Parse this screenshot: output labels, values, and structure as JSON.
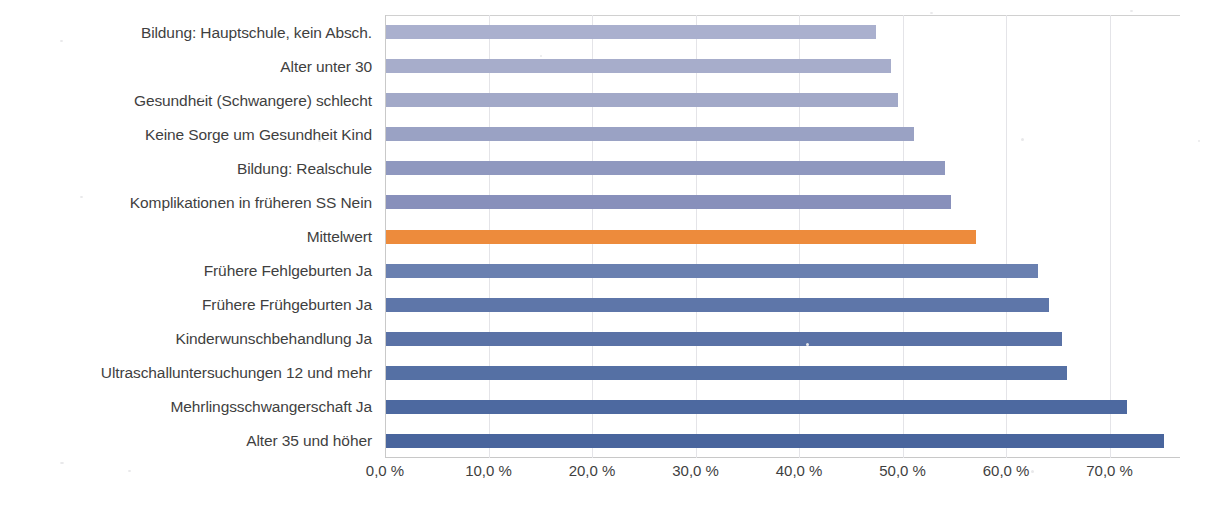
{
  "chart_data": {
    "type": "bar",
    "orientation": "horizontal",
    "title": "",
    "xlabel": "",
    "ylabel": "",
    "xlim": [
      0,
      76.8
    ],
    "grid": true,
    "legend": false,
    "tick_labels": [
      "0,0 %",
      "10,0 %",
      "20,0 %",
      "30,0 %",
      "40,0 %",
      "50,0 %",
      "60,0 %",
      "70,0 %"
    ],
    "tick_values": [
      0,
      10,
      20,
      30,
      40,
      50,
      60,
      70
    ],
    "categories": [
      "Bildung: Hauptschule, kein Absch.",
      "Alter unter 30",
      "Gesundheit (Schwangere) schlecht",
      "Keine Sorge um Gesundheit Kind",
      "Bildung: Realschule",
      "Komplikationen in früheren SS Nein",
      "Mittelwert",
      "Frühere Fehlgeburten Ja",
      "Frühere Frühgeburten Ja",
      "Kinderwunschbehandlung Ja",
      "Ultraschalluntersuchungen 12 und mehr",
      "Mehrlingsschwangerschaft Ja",
      "Alter 35 und höher"
    ],
    "values": [
      47.3,
      48.8,
      49.5,
      51.0,
      54.0,
      54.6,
      57.0,
      63.0,
      64.0,
      65.3,
      65.8,
      71.6,
      75.2
    ],
    "bar_colors": [
      "#aab0ce",
      "#a7adcb",
      "#a2a9c8",
      "#9aa2c4",
      "#8f98bf",
      "#8890bb",
      "#ed8b3c",
      "#6a80b0",
      "#5e76a9",
      "#5a72a6",
      "#5570a4",
      "#4d69a0",
      "#49659d"
    ],
    "highlight_category": "Mittelwert",
    "highlight_color": "#ed8b3c"
  },
  "colors": {
    "gridline": "#e4e4e8",
    "axis": "#c9c9c9",
    "text": "#3f3f3f",
    "background": "#ffffff"
  }
}
